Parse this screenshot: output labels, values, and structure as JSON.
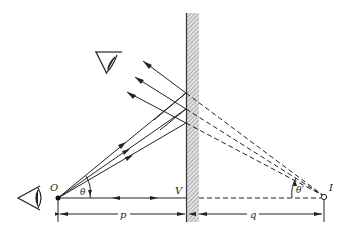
{
  "figure": {
    "labels": {
      "object_point": "O",
      "image_point": "I",
      "vertex": "V",
      "object_distance": "p",
      "image_distance": "q",
      "object_angle": "θ",
      "image_angle": "θ′"
    },
    "colors": {
      "ink": "#222222",
      "mirror_hatch": "#9a9a9a",
      "mirror_fill": "#d8d8d8",
      "background": "#ffffff"
    }
  }
}
